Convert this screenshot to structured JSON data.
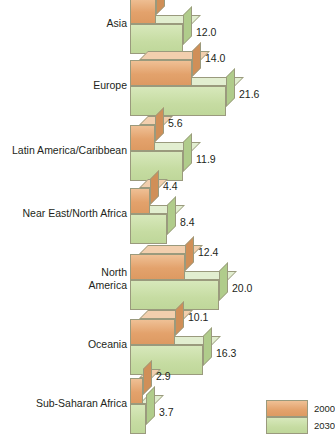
{
  "chart_data": {
    "type": "bar",
    "orientation": "horizontal",
    "title": "",
    "subtitle": "",
    "xlabel": "",
    "ylabel": "",
    "grid": false,
    "legend_position": "bottom-right",
    "categories": [
      "Asia",
      "Europe",
      "Latin America/Caribbean",
      "Near East/North Africa",
      "North\nAmerica",
      "Oceania",
      "Sub-Saharan Africa"
    ],
    "series": [
      {
        "name": "2000",
        "color": "#e3a26c",
        "values": [
          5.9,
          14.0,
          5.6,
          4.4,
          12.4,
          10.1,
          2.9
        ]
      },
      {
        "name": "2030",
        "color": "#c6dca2",
        "values": [
          12.0,
          21.6,
          11.9,
          8.4,
          20.0,
          16.3,
          3.7
        ]
      }
    ],
    "value_labels": {
      "2000": [
        "5.9",
        "14.0",
        "5.6",
        "4.4",
        "12.4",
        "10.1",
        "2.9"
      ],
      "2030": [
        "12.0",
        "21.6",
        "11.9",
        "8.4",
        "20.0",
        "16.3",
        "3.7"
      ]
    },
    "xlim": [
      0,
      21.6
    ]
  },
  "legend": {
    "items": [
      {
        "label": "2000",
        "color": "#e3a26c"
      },
      {
        "label": "2030",
        "color": "#c6dca2"
      }
    ]
  },
  "colors": {
    "orange_2000": "#e3a26c",
    "green_2030": "#c6dca2",
    "outline": "#9a9a7d",
    "text": "#231f20",
    "background": "#ffffff"
  }
}
